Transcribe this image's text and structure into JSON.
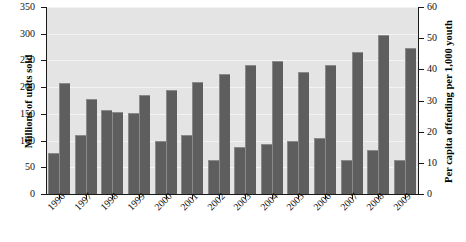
{
  "chart_data": {
    "type": "bar",
    "title": "",
    "categories": [
      "1996",
      "1997",
      "1998",
      "1999",
      "2000",
      "2001",
      "2002",
      "2003",
      "2004",
      "2005",
      "2006",
      "2007",
      "2008",
      "2009"
    ],
    "series": [
      {
        "name": "Per capita offending per 1,000 youth",
        "axis": "right",
        "values": [
          13,
          19,
          27,
          26,
          17,
          19,
          11,
          15,
          16,
          17,
          18,
          11,
          14,
          11
        ]
      },
      {
        "name": "Millions of units sold",
        "axis": "left",
        "values": [
          207,
          178,
          153,
          185,
          194,
          210,
          225,
          241,
          249,
          228,
          241,
          266,
          298,
          273
        ]
      }
    ],
    "left_axis": {
      "label": "Millions of units sold",
      "ticks": [
        0,
        50,
        100,
        150,
        200,
        250,
        300,
        350
      ],
      "min": 0,
      "max": 350
    },
    "right_axis": {
      "label": "Per capita offending per 1,000 youth",
      "ticks": [
        0,
        10,
        20,
        30,
        40,
        50,
        60
      ],
      "min": 0,
      "max": 60
    },
    "xlabel": "",
    "grid": true,
    "legend": "none",
    "colors": {
      "bar": "#5e5e5e",
      "plot_background": "#e4e4e4",
      "gridline": "#f3f3f3",
      "axis": "#1a1a1a",
      "text": "#111111"
    }
  }
}
